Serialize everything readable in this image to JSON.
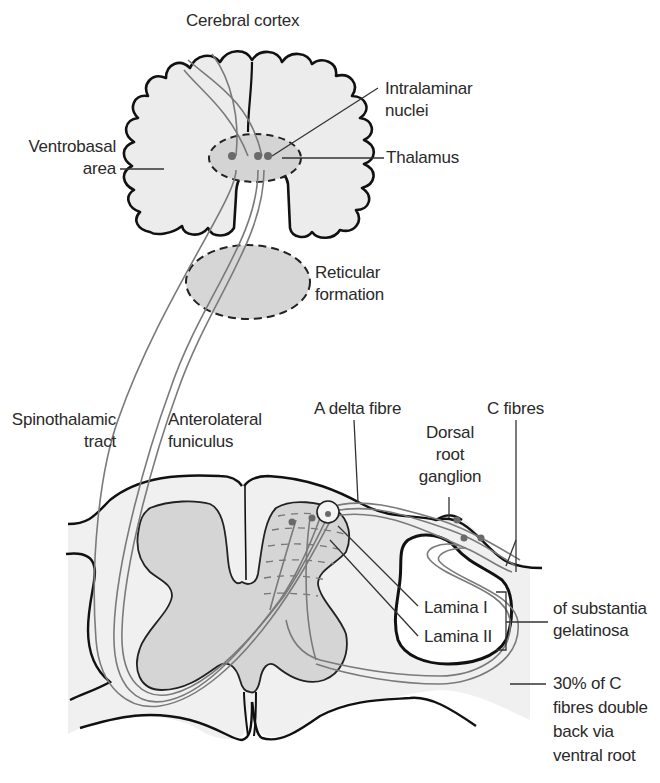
{
  "colors": {
    "outline": "#111111",
    "fill_light": "#efefef",
    "fill_grey": "#d4d4d4",
    "fibre": "#7a7a7a",
    "neuron_dot": "#6a6a6a",
    "text": "#2a2a2a"
  },
  "labels": {
    "cerebral_cortex": "Cerebral cortex",
    "intralaminar": {
      "line1": "Intralaminar",
      "line2": "nuclei"
    },
    "ventrobasal": {
      "line1": "Ventrobasal",
      "line2": "area"
    },
    "thalamus": "Thalamus",
    "reticular": {
      "line1": "Reticular",
      "line2": "formation"
    },
    "spinothalamic": {
      "line1": "Spinothalamic",
      "line2": "tract"
    },
    "anterolateral": {
      "line1": "Anterolateral",
      "line2": "funiculus"
    },
    "a_delta": "A delta fibre",
    "c_fibres": "C fibres",
    "drg": {
      "line1": "Dorsal",
      "line2": "root",
      "line3": "ganglion"
    },
    "lamina1": "Lamina I",
    "lamina2": "Lamina II",
    "substantia": {
      "line1": "of substantia",
      "line2": "gelatinosa"
    },
    "c_fibre_note": {
      "line1": "30% of C",
      "line2": "fibres double",
      "line3": "back via",
      "line4": "ventral root"
    }
  }
}
